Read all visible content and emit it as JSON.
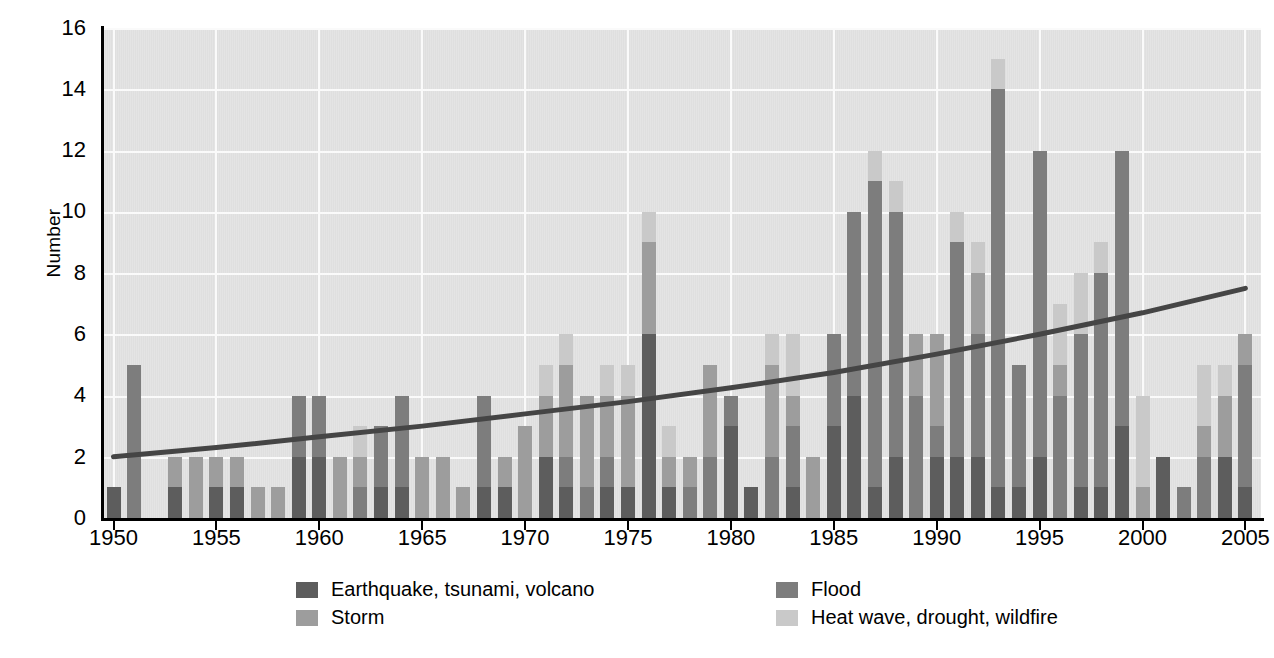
{
  "chart": {
    "type": "bar",
    "ylabel": "Number",
    "xlabel": "",
    "yticks": [
      "0",
      "2",
      "4",
      "6",
      "8",
      "10",
      "12",
      "14",
      "16"
    ],
    "xticks": [
      "1950",
      "1955",
      "1960",
      "1965",
      "1970",
      "1975",
      "1980",
      "1985",
      "1990",
      "1995",
      "2000",
      "2005"
    ],
    "ylim": [
      0,
      16
    ],
    "xlim": [
      1950,
      2005
    ],
    "grid": "horizontal-and-vertical",
    "legend_position": "bottom"
  },
  "legend": {
    "items": [
      {
        "key": "earthquake",
        "label": "Earthquake, tsunami, volcano",
        "color": "#5d5d5d",
        "col": 0,
        "row": 0
      },
      {
        "key": "flood",
        "label": "Flood",
        "color": "#7d7d7d",
        "col": 1,
        "row": 0
      },
      {
        "key": "storm",
        "label": "Storm",
        "color": "#9d9d9d",
        "col": 0,
        "row": 1
      },
      {
        "key": "heatwave",
        "label": "Heat wave, drought, wildfire",
        "color": "#c9c9c9",
        "col": 1,
        "row": 1
      }
    ]
  },
  "chart_data": {
    "type": "bar",
    "stacked": true,
    "title": "",
    "xlabel": "",
    "ylabel": "Number",
    "ylim": [
      0,
      16
    ],
    "xlim": [
      1950,
      2005
    ],
    "grid": true,
    "legend_position": "bottom",
    "categories": [
      1950,
      1951,
      1952,
      1953,
      1954,
      1955,
      1956,
      1957,
      1958,
      1959,
      1960,
      1961,
      1962,
      1963,
      1964,
      1965,
      1966,
      1967,
      1968,
      1969,
      1970,
      1971,
      1972,
      1973,
      1974,
      1975,
      1976,
      1977,
      1978,
      1979,
      1980,
      1981,
      1982,
      1983,
      1984,
      1985,
      1986,
      1987,
      1988,
      1989,
      1990,
      1991,
      1992,
      1993,
      1994,
      1995,
      1996,
      1997,
      1998,
      1999,
      2000,
      2001,
      2002,
      2003,
      2004,
      2005
    ],
    "series": [
      {
        "name": "Earthquake, tsunami, volcano",
        "color": "#5d5d5d",
        "values": [
          1,
          0,
          0,
          1,
          0,
          1,
          1,
          0,
          0,
          2,
          2,
          0,
          0,
          1,
          1,
          0,
          0,
          0,
          1,
          1,
          0,
          2,
          1,
          0,
          1,
          1,
          6,
          1,
          0,
          0,
          3,
          1,
          0,
          1,
          0,
          3,
          4,
          1,
          2,
          0,
          2,
          2,
          2,
          1,
          1,
          2,
          0,
          1,
          1,
          3,
          0,
          2,
          0,
          0,
          2,
          1
        ]
      },
      {
        "name": "Flood",
        "color": "#7d7d7d",
        "values": [
          0,
          5,
          0,
          0,
          0,
          0,
          0,
          0,
          0,
          2,
          2,
          0,
          1,
          2,
          3,
          0,
          0,
          0,
          3,
          0,
          0,
          0,
          1,
          1,
          1,
          0,
          0,
          0,
          1,
          2,
          1,
          0,
          2,
          2,
          0,
          3,
          6,
          10,
          8,
          4,
          1,
          7,
          4,
          13,
          4,
          10,
          4,
          5,
          7,
          9,
          0,
          0,
          1,
          2,
          0,
          4
        ]
      },
      {
        "name": "Storm",
        "color": "#9d9d9d",
        "values": [
          0,
          0,
          0,
          1,
          2,
          1,
          1,
          1,
          1,
          0,
          0,
          2,
          1,
          0,
          0,
          2,
          2,
          1,
          0,
          1,
          3,
          2,
          3,
          3,
          2,
          3,
          3,
          1,
          1,
          3,
          0,
          0,
          3,
          1,
          2,
          0,
          0,
          0,
          0,
          2,
          3,
          0,
          2,
          0,
          0,
          0,
          1,
          0,
          0,
          0,
          1,
          0,
          0,
          1,
          2,
          1
        ]
      },
      {
        "name": "Heat wave, drought, wildfire",
        "color": "#c9c9c9",
        "values": [
          0,
          0,
          0,
          0,
          0,
          0,
          0,
          0,
          0,
          0,
          0,
          0,
          1,
          0,
          0,
          0,
          0,
          0,
          0,
          0,
          0,
          1,
          1,
          0,
          1,
          1,
          1,
          1,
          0,
          0,
          0,
          0,
          1,
          2,
          0,
          0,
          0,
          1,
          1,
          0,
          0,
          1,
          1,
          1,
          0,
          0,
          2,
          2,
          1,
          0,
          3,
          0,
          0,
          2,
          1,
          0
        ]
      }
    ],
    "trend": {
      "name": "trend",
      "color": "#454545",
      "x": [
        1950,
        1955,
        1960,
        1965,
        1970,
        1975,
        1980,
        1985,
        1990,
        1995,
        2000,
        2005
      ],
      "y": [
        2.0,
        2.3,
        2.65,
        3.0,
        3.4,
        3.8,
        4.25,
        4.75,
        5.35,
        6.0,
        6.7,
        7.5
      ]
    }
  }
}
